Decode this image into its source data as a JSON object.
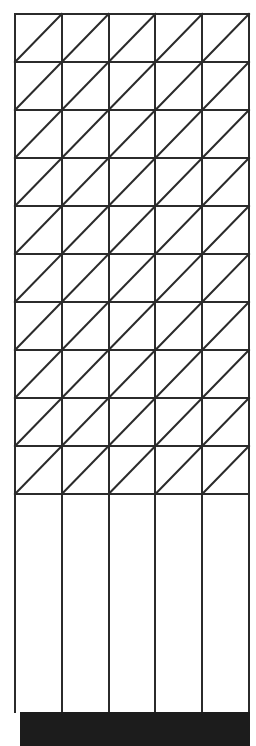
{
  "figure": {
    "type": "geometric-line-figure",
    "canvas": {
      "width": 256,
      "height": 746,
      "background": "#ffffff"
    },
    "style": {
      "line_color": "#2b2b2b",
      "line_width": 2,
      "cell_fill": "#ffffff",
      "footer_color": "#1c1c1c"
    },
    "grid": {
      "label": "triangulated-grid",
      "origin_x": 15,
      "origin_y": 14,
      "columns": 5,
      "rows": 10,
      "cell_width": 46.8,
      "cell_height": 48.0,
      "diagonal_direction": "bottom-left-to-top-right",
      "diagonal_glyph": "/",
      "column_x_positions": [
        15,
        61.8,
        108.6,
        155.4,
        202.2,
        249
      ],
      "row_y_positions": [
        14,
        62,
        110,
        158,
        206,
        254,
        302,
        350,
        398,
        446,
        494
      ]
    },
    "lower_section": {
      "label": "plain-column-band",
      "top_y": 494,
      "bottom_y": 712,
      "columns": 5,
      "has_horizontal_lines": false,
      "has_diagonals": false,
      "column_x_positions": [
        15,
        61.8,
        108.6,
        155.4,
        202.2,
        249
      ]
    },
    "footer": {
      "label": "solid-dark-bar",
      "x": 20,
      "y": 712,
      "width": 230,
      "height": 34,
      "color": "#1c1c1c"
    }
  }
}
